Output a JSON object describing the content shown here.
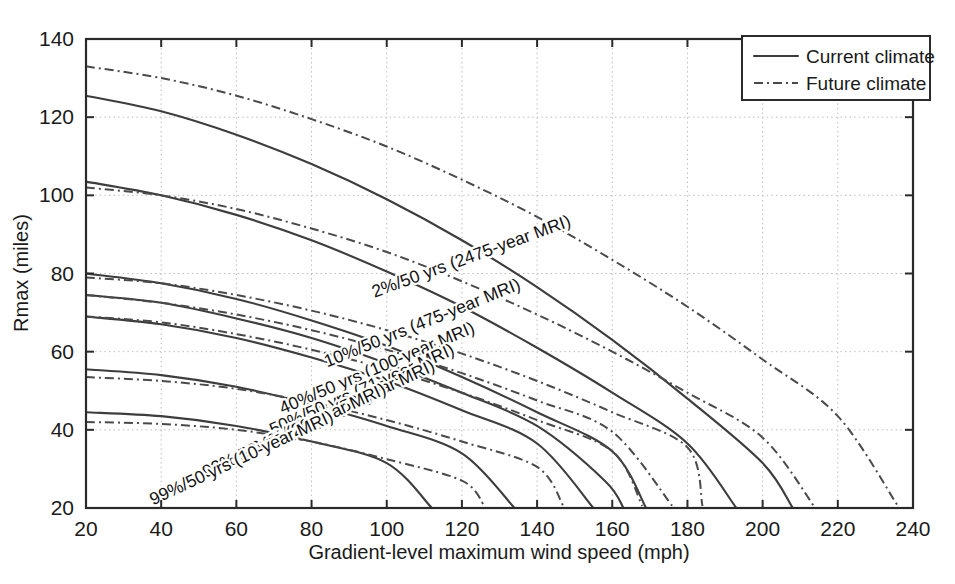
{
  "chart_data": {
    "type": "line",
    "title": "",
    "xlabel": "Gradient-level maximum wind speed (mph)",
    "ylabel": "Rmax (miles)",
    "xlim": [
      20,
      240
    ],
    "ylim": [
      20,
      140
    ],
    "xticks": [
      20,
      40,
      60,
      80,
      100,
      120,
      140,
      160,
      180,
      200,
      220,
      240
    ],
    "yticks": [
      20,
      40,
      60,
      80,
      100,
      120,
      140
    ],
    "grid": true,
    "legend_position": "top-right",
    "legend": [
      {
        "label": "Current climate",
        "style": "solid"
      },
      {
        "label": "Future climate",
        "style": "dash-dot"
      }
    ],
    "series": [
      {
        "name": "2%/50 yrs (2475-year MRI) - Current climate",
        "style": "solid",
        "annotation": "2%/50 yrs (2475-year MRI)",
        "x": [
          20,
          40,
          60,
          80,
          100,
          120,
          140,
          160,
          180,
          200,
          208
        ],
        "y": [
          125.5,
          121.5,
          115.5,
          108.0,
          99.0,
          88.5,
          76.5,
          63.0,
          48.0,
          31.5,
          20.0
        ]
      },
      {
        "name": "2%/50 yrs (2475-year MRI) - Future climate",
        "style": "dash-dot",
        "annotation": "",
        "x": [
          20,
          40,
          60,
          80,
          100,
          120,
          140,
          160,
          180,
          200,
          220,
          236
        ],
        "y": [
          133.0,
          130.0,
          125.5,
          119.5,
          112.5,
          104.0,
          94.5,
          83.5,
          71.5,
          58.0,
          43.5,
          20.5
        ]
      },
      {
        "name": "10%/50 yrs (475-year MRI) - Current climate",
        "style": "solid",
        "annotation": "10%/50 yrs (475-year MRI)",
        "x": [
          20,
          40,
          60,
          80,
          100,
          120,
          140,
          160,
          180,
          193
        ],
        "y": [
          103.5,
          100.0,
          95.0,
          88.5,
          80.5,
          71.5,
          61.0,
          49.5,
          36.5,
          20.0
        ]
      },
      {
        "name": "10%/50 yrs (475-year MRI) - Future climate",
        "style": "dash-dot",
        "annotation": "",
        "x": [
          20,
          40,
          60,
          80,
          100,
          120,
          140,
          160,
          180,
          200,
          214
        ],
        "y": [
          102.0,
          100.0,
          96.5,
          91.5,
          85.5,
          78.0,
          69.5,
          60.0,
          49.5,
          38.0,
          20.0
        ]
      },
      {
        "name": "40%/50 yrs (100-year MRI) - Current climate",
        "style": "solid",
        "annotation": "40%/50 yrs (100-year MRI)",
        "x": [
          20,
          40,
          60,
          80,
          100,
          120,
          140,
          160,
          169
        ],
        "y": [
          80.0,
          77.5,
          73.5,
          68.0,
          61.5,
          53.5,
          44.5,
          34.5,
          20.0
        ]
      },
      {
        "name": "40%/50 yrs (100-year MRI) - Future climate",
        "style": "dash-dot",
        "annotation": "",
        "x": [
          20,
          40,
          60,
          80,
          100,
          120,
          140,
          160,
          180,
          184
        ],
        "y": [
          79.0,
          77.5,
          74.5,
          70.5,
          65.5,
          59.5,
          52.5,
          44.5,
          35.5,
          20.5
        ]
      },
      {
        "name": "50%/50 yrs (71-year MRI) - Current climate",
        "style": "solid",
        "annotation": "50%/50 yrs (71-year MRI)",
        "x": [
          20,
          40,
          60,
          80,
          100,
          120,
          140,
          158,
          163
        ],
        "y": [
          74.5,
          72.5,
          68.5,
          63.5,
          57.0,
          49.5,
          41.0,
          27.0,
          20.0
        ]
      },
      {
        "name": "50%/50 yrs (71-year MRI) - Future climate",
        "style": "dash-dot",
        "annotation": "",
        "x": [
          20,
          40,
          60,
          80,
          100,
          120,
          140,
          160,
          176
        ],
        "y": [
          74.5,
          72.5,
          69.5,
          65.5,
          60.5,
          54.5,
          47.5,
          39.5,
          20.5
        ]
      },
      {
        "name": "64%/50 yrs (50-year MRI) - Current climate",
        "style": "solid",
        "annotation": "64%/50 yrs (50-year MRI)",
        "x": [
          20,
          40,
          60,
          80,
          100,
          120,
          140,
          155
        ],
        "y": [
          69.0,
          67.0,
          63.5,
          58.5,
          52.5,
          45.0,
          36.5,
          20.0
        ]
      },
      {
        "name": "64%/50 yrs (50-year MRI) - Future climate",
        "style": "dash-dot",
        "annotation": "",
        "x": [
          20,
          40,
          60,
          80,
          100,
          120,
          140,
          160,
          168
        ],
        "y": [
          69.0,
          67.5,
          64.5,
          60.5,
          55.5,
          49.5,
          42.5,
          34.5,
          20.5
        ]
      },
      {
        "name": "92%/50 yrs (20-year MRI) - Current climate",
        "style": "solid",
        "annotation": "92%/50 yrs (20-year MRI)",
        "x": [
          20,
          40,
          60,
          80,
          100,
          120,
          134
        ],
        "y": [
          55.5,
          54.0,
          51.0,
          46.5,
          41.0,
          34.0,
          20.0
        ]
      },
      {
        "name": "92%/50 yrs (20-year MRI) - Future climate",
        "style": "dash-dot",
        "annotation": "",
        "x": [
          20,
          40,
          60,
          80,
          100,
          120,
          140,
          147
        ],
        "y": [
          53.5,
          52.5,
          50.5,
          47.0,
          42.5,
          37.0,
          30.5,
          20.5
        ]
      },
      {
        "name": "99%/50 yrs (10-year MRI) - Current climate",
        "style": "solid",
        "annotation": "99%/50 yrs (10-year MRI)",
        "x": [
          20,
          40,
          60,
          80,
          100,
          112
        ],
        "y": [
          44.5,
          43.5,
          41.0,
          37.0,
          31.5,
          20.0
        ]
      },
      {
        "name": "99%/50 yrs (10-year MRI) - Future climate",
        "style": "dash-dot",
        "annotation": "",
        "x": [
          20,
          40,
          60,
          80,
          100,
          120,
          126
        ],
        "y": [
          42.0,
          41.5,
          40.0,
          37.0,
          32.5,
          27.0,
          20.5
        ]
      }
    ],
    "annotations": [
      {
        "text": "2%/50 yrs (2475-year MRI)",
        "x": 123,
        "y": 83,
        "rotation": -20
      },
      {
        "text": "10%/50 yrs (475-year MRI)",
        "x": 110,
        "y": 66,
        "rotation": -22
      },
      {
        "text": "40%/50 yrs (100-year MRI)",
        "x": 98,
        "y": 54.5,
        "rotation": -23
      },
      {
        "text": "50%/50 yrs (71-year MRI)",
        "x": 94,
        "y": 49,
        "rotation": -24
      },
      {
        "text": "64%/50 yrs (50-year MRI)",
        "x": 89,
        "y": 44.5,
        "rotation": -25
      },
      {
        "text": "92%/50 yrs (20-year MRI)",
        "x": 76,
        "y": 38.5,
        "rotation": -25
      },
      {
        "text": "99%/50 yrs (10-year MRI)",
        "x": 62,
        "y": 31.5,
        "rotation": -25
      }
    ]
  }
}
